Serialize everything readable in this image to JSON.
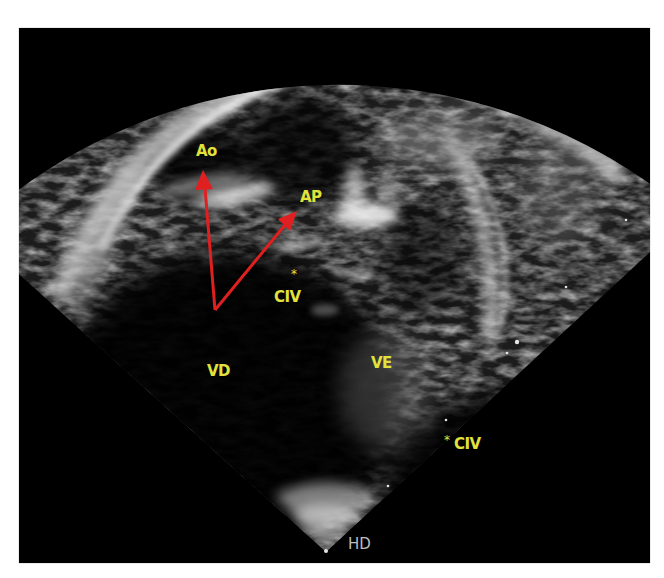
{
  "image": {
    "type": "echocardiogram",
    "view": "subcostal / short-axis outflow view",
    "frame": {
      "x": 19,
      "y": 28,
      "width": 631,
      "height": 535,
      "background": "#000000"
    },
    "sector_apex": {
      "x": 326,
      "y": 552
    }
  },
  "labels": {
    "ao": "Ao",
    "ap": "AP",
    "civ_upper": "CIV",
    "civ_upper_marker": "*",
    "vd": "VD",
    "ve": "VE",
    "civ_lower": "CIV",
    "civ_lower_marker": "*",
    "hd": "HD"
  },
  "colors": {
    "label": "#e2e23c",
    "arrow": "#e02020",
    "hd_text": "#bdbdbd"
  },
  "arrows": [
    {
      "from": {
        "x": 215,
        "y": 310
      },
      "to": {
        "x": 203,
        "y": 170
      },
      "points_to": "Ao"
    },
    {
      "from": {
        "x": 215,
        "y": 310
      },
      "to": {
        "x": 296,
        "y": 212
      },
      "points_to": "AP"
    }
  ],
  "depth_markers": [
    {
      "x": 626,
      "y": 220
    },
    {
      "x": 566,
      "y": 287
    },
    {
      "x": 517,
      "y": 342
    },
    {
      "x": 507,
      "y": 353
    },
    {
      "x": 446,
      "y": 420
    },
    {
      "x": 388,
      "y": 486
    }
  ]
}
